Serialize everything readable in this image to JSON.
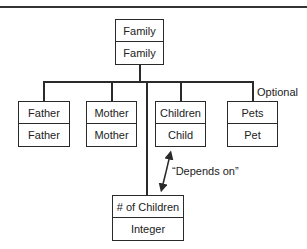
{
  "diagram": {
    "type": "hierarchy",
    "root": {
      "name": "Family",
      "type": "Family"
    },
    "children": [
      {
        "name": "Father",
        "type": "Father"
      },
      {
        "name": "Mother",
        "type": "Mother"
      },
      {
        "name": "Children",
        "type": "Child"
      },
      {
        "name": "Pets",
        "type": "Pet",
        "annotation": "Optional"
      }
    ],
    "dependent": {
      "name": "# of Children",
      "type": "Integer"
    },
    "relation": {
      "label": "“Depends on”",
      "from": "# of Children",
      "to": "Children"
    }
  },
  "colors": {
    "line": "#2a2a2a",
    "background": "#ffffff",
    "text": "#222222"
  }
}
